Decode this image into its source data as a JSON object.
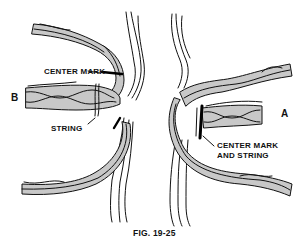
{
  "figure": {
    "caption": "FIG. 19-25",
    "colors": {
      "strand_fill": "#c8c8c8",
      "outline": "#111111",
      "background": "#ffffff",
      "mark": "#000000"
    }
  },
  "left_panel": {
    "end_label": "B",
    "labels": {
      "center_mark": "CENTER MARK",
      "string": "STRING"
    }
  },
  "right_panel": {
    "end_label": "A",
    "labels": {
      "center_mark_line1": "CENTER MARK",
      "center_mark_line2": "AND STRING"
    }
  }
}
